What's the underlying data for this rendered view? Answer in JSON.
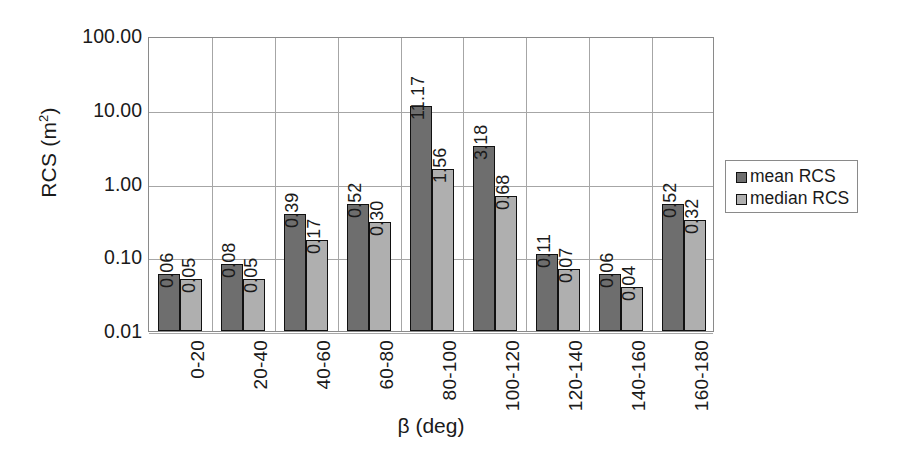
{
  "chart_data": {
    "type": "bar",
    "title": "",
    "xlabel": "β (deg)",
    "ylabel": "RCS (m²)",
    "ylabel_base": "RCS (m",
    "ylabel_sup": "2",
    "ylabel_tail": ")",
    "yscale": "log",
    "ylim": [
      0.01,
      100
    ],
    "grid": "horizontal-and-category-separators",
    "legend_position": "right",
    "categories": [
      "0-20",
      "20-40",
      "40-60",
      "60-80",
      "80-100",
      "100-120",
      "120-140",
      "140-160",
      "160-180"
    ],
    "y_ticks": [
      "100.00",
      "10.00",
      "1.00",
      "0.10",
      "0.01"
    ],
    "y_tick_values": [
      100,
      10,
      1,
      0.1,
      0.01
    ],
    "series": [
      {
        "name": "mean RCS",
        "color": "#6e6e6e",
        "values": [
          0.06,
          0.08,
          0.39,
          0.52,
          11.17,
          3.18,
          0.11,
          0.06,
          0.52
        ],
        "labels": [
          "0.06",
          "0.08",
          "0.39",
          "0.52",
          "11.17",
          "3.18",
          "0.11",
          "0.06",
          "0.52"
        ]
      },
      {
        "name": "median RCS",
        "color": "#afafaf",
        "values": [
          0.05,
          0.05,
          0.17,
          0.3,
          1.56,
          0.68,
          0.07,
          0.04,
          0.32
        ],
        "labels": [
          "0.05",
          "0.05",
          "0.17",
          "0.30",
          "1.56",
          "0.68",
          "0.07",
          "0.04",
          "0.32"
        ]
      }
    ]
  },
  "legend": {
    "items": [
      {
        "label": "mean RCS",
        "swatch": "mean"
      },
      {
        "label": "median RCS",
        "swatch": "median"
      }
    ]
  }
}
